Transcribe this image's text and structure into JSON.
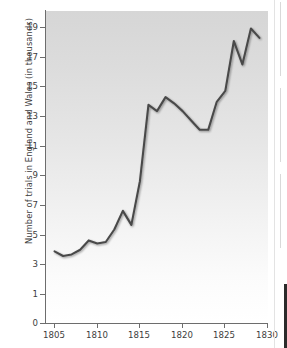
{
  "chart_data": {
    "type": "line",
    "title": "",
    "xlabel": "",
    "ylabel": "Number of trials in England and Wales (in thousands)",
    "xlim": [
      1804,
      1830
    ],
    "ylim": [
      0,
      20
    ],
    "grid": false,
    "legend": "none",
    "line_color": "#4a4a4a",
    "xticks": [
      1805,
      1810,
      1815,
      1820,
      1825,
      1830
    ],
    "yticks": [
      0,
      1,
      3,
      5,
      7,
      9,
      11,
      13,
      15,
      17,
      19
    ],
    "x": [
      1805,
      1806,
      1807,
      1808,
      1809,
      1810,
      1811,
      1812,
      1813,
      1814,
      1815,
      1816,
      1817,
      1818,
      1819,
      1820,
      1821,
      1822,
      1823,
      1824,
      1825,
      1826,
      1827,
      1828,
      1829
    ],
    "values": [
      4.6,
      4.3,
      4.4,
      4.7,
      5.3,
      5.1,
      5.2,
      6.0,
      7.2,
      6.3,
      9.1,
      14.0,
      13.6,
      14.5,
      14.1,
      13.6,
      13.0,
      12.4,
      12.4,
      14.2,
      14.9,
      18.1,
      16.6,
      18.9,
      18.3
    ],
    "series_name": "Number of trials"
  },
  "axis": {
    "y_title": "Number of trials in England and Wales (in thousands)",
    "y_tick_labels": [
      "19",
      "17",
      "15",
      "13",
      "11",
      "9",
      "7",
      "5",
      "3",
      "1",
      "0"
    ],
    "x_tick_labels": [
      "1805",
      "1810",
      "1815",
      "1820",
      "1825",
      "1830"
    ]
  }
}
